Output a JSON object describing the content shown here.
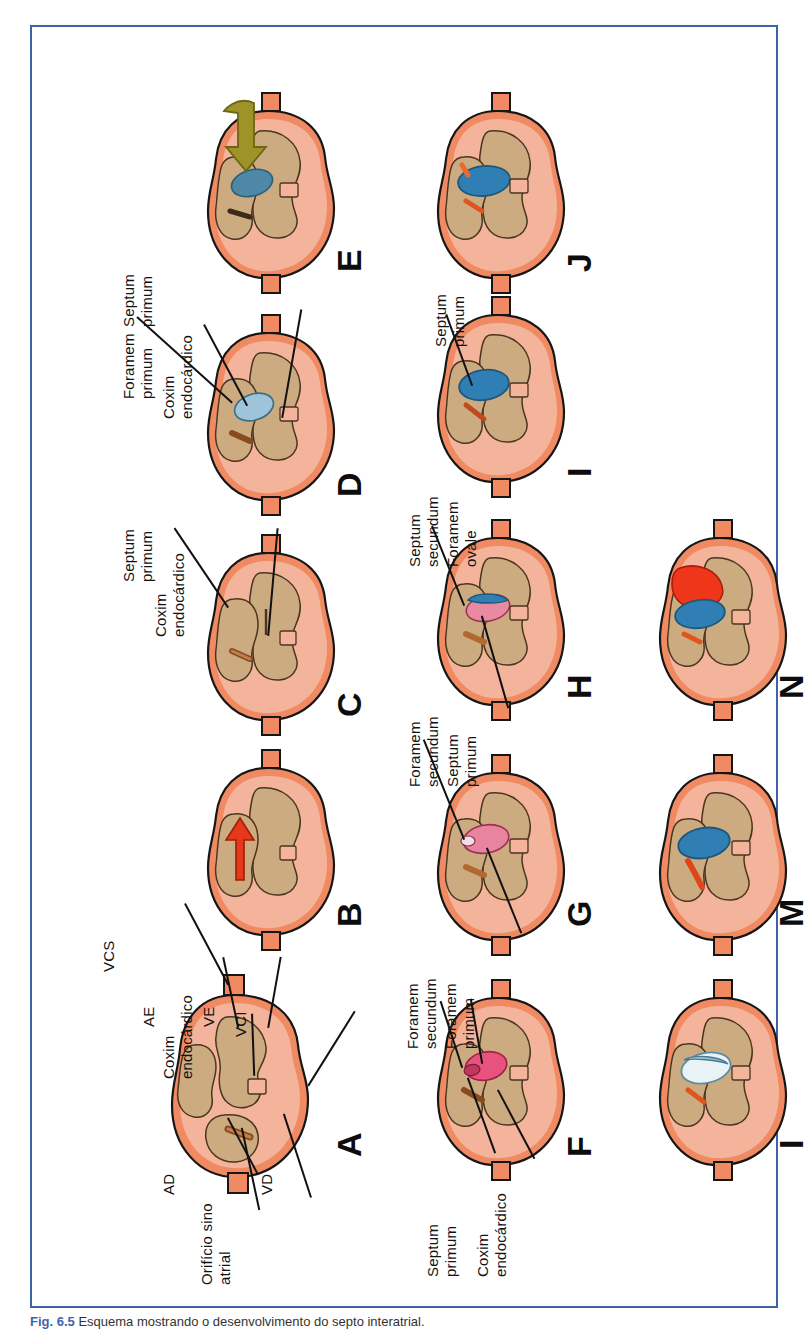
{
  "figure": {
    "caption_number": "Fig. 6.5",
    "caption_text": "Esquema mostrando o desenvolvimento do septo interatrial.",
    "frame_color": "#3f63a8"
  },
  "colors": {
    "myocardium_outer": "#f08a62",
    "myocardium_mid": "#f4b49c",
    "lumen": "#cdab80",
    "septum_blue": "#2f7fb5",
    "septum_pink": "#e8527f",
    "septum_pale": "#cfe2ec",
    "blood_red": "#f0361a",
    "arrow_red": "#e8381c",
    "arrow_olive": "#9d9327",
    "outline": "#161616"
  },
  "panels": [
    {
      "id": "A",
      "letter": "A",
      "labels": [
        {
          "name": "vcs",
          "text": "VCS"
        },
        {
          "name": "ae",
          "text": "AE"
        },
        {
          "name": "coxim-endocardico",
          "text": "Coxim\nendocárdico"
        },
        {
          "name": "ve",
          "text": "VE"
        },
        {
          "name": "vci",
          "text": "VCI"
        },
        {
          "name": "ad",
          "text": "AD"
        },
        {
          "name": "orificio-sino-atrial",
          "text": "Orifício sino\natrial"
        },
        {
          "name": "vd",
          "text": "VD"
        }
      ]
    },
    {
      "id": "B",
      "letter": "B",
      "labels": []
    },
    {
      "id": "C",
      "letter": "C",
      "labels": [
        {
          "name": "septum-primum",
          "text": "Septum\nprimum"
        },
        {
          "name": "coxim-endocardico",
          "text": "Coxim\nendocárdico"
        }
      ]
    },
    {
      "id": "D",
      "letter": "D",
      "labels": [
        {
          "name": "septum-primum",
          "text": "Septum\nprimum"
        },
        {
          "name": "foramem-primum",
          "text": "Foramem\nprimum"
        },
        {
          "name": "coxim-endocardico",
          "text": "Coxim\nendocárdico"
        }
      ]
    },
    {
      "id": "E",
      "letter": "E",
      "labels": []
    },
    {
      "id": "F",
      "letter": "F",
      "labels": [
        {
          "name": "foramem-secundum",
          "text": "Foramem\nsecundum"
        },
        {
          "name": "foramem-primum",
          "text": "Foramem\nprimum"
        },
        {
          "name": "septum-primum",
          "text": "Septum\nprimum"
        },
        {
          "name": "coxim-endocardico",
          "text": "Coxim\nendocárdico"
        }
      ]
    },
    {
      "id": "G",
      "letter": "G",
      "labels": [
        {
          "name": "foramem-secundum",
          "text": "Foramem\nsecundum"
        },
        {
          "name": "septum-primum",
          "text": "Septum\nprimum"
        }
      ]
    },
    {
      "id": "H",
      "letter": "H",
      "labels": [
        {
          "name": "septum-secundum",
          "text": "Septum\nsecundum"
        },
        {
          "name": "foramem-ovale",
          "text": "Foramem\novale"
        }
      ]
    },
    {
      "id": "I-top",
      "letter": "I",
      "labels": [
        {
          "name": "septum-primum",
          "text": "Septum\nprimum"
        }
      ]
    },
    {
      "id": "J",
      "letter": "J",
      "labels": []
    },
    {
      "id": "L",
      "letter": "I",
      "labels": []
    },
    {
      "id": "M",
      "letter": "M",
      "labels": []
    },
    {
      "id": "N",
      "letter": "N",
      "labels": []
    }
  ],
  "labels_flat": {
    "vcs": "VCS",
    "ae": "AE",
    "ve": "VE",
    "vci": "VCI",
    "ad": "AD",
    "vd": "VD",
    "coxim": "Coxim",
    "endocardico": "endocárdico",
    "orificio_sino": "Orifício sino",
    "atrial": "atrial",
    "septum": "Septum",
    "primum": "primum",
    "secundum": "secundum",
    "foramem": "Foramem",
    "ovale": "ovale"
  },
  "letters": {
    "A": "A",
    "B": "B",
    "C": "C",
    "D": "D",
    "E": "E",
    "F": "F",
    "G": "G",
    "H": "H",
    "I": "I",
    "J": "J",
    "L": "I",
    "M": "M",
    "N": "N"
  }
}
